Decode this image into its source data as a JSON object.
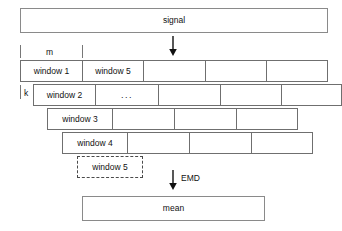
{
  "diagram": {
    "title_box": {
      "label": "signal"
    },
    "output_box": {
      "label": "mean"
    },
    "measures": {
      "m_label": "m",
      "k_label": "k"
    },
    "arrows": {
      "signal_to_windows": {
        "icon": "down-arrow-icon",
        "label": ""
      },
      "windows_to_mean": {
        "icon": "down-arrow-icon",
        "label": "EMD"
      }
    },
    "window_rows": [
      {
        "name": "window-row-1",
        "cells": [
          {
            "label": "window 1"
          },
          {
            "label": "window 5"
          },
          {
            "label": ""
          },
          {
            "label": ""
          },
          {
            "label": ""
          }
        ]
      },
      {
        "name": "window-row-2",
        "cells": [
          {
            "label": "window 2"
          },
          {
            "label": "..."
          },
          {
            "label": ""
          },
          {
            "label": ""
          },
          {
            "label": ""
          }
        ]
      },
      {
        "name": "window-row-3",
        "cells": [
          {
            "label": "window 3"
          },
          {
            "label": ""
          },
          {
            "label": ""
          },
          {
            "label": ""
          }
        ]
      },
      {
        "name": "window-row-4",
        "cells": [
          {
            "label": "window 4"
          },
          {
            "label": ""
          },
          {
            "label": ""
          },
          {
            "label": ""
          }
        ]
      }
    ],
    "pending_window": {
      "label": "window 5"
    }
  },
  "colors": {
    "background": "#ffffff",
    "stroke": "#6f6f6f",
    "text": "#111111",
    "dashed_stroke": "#4a4a4a"
  }
}
